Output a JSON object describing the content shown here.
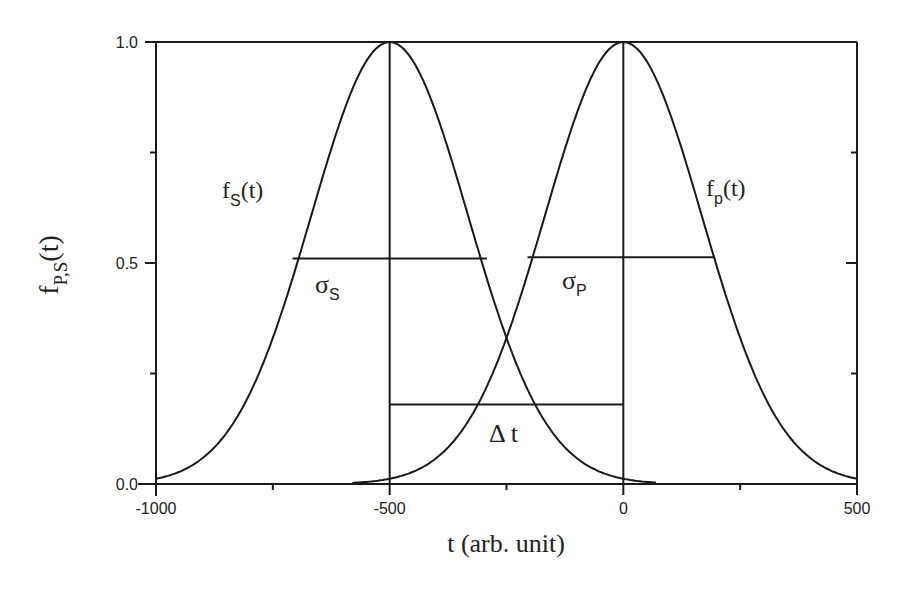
{
  "chart_data": {
    "type": "line",
    "title": "",
    "xlabel": "t (arb. unit)",
    "ylabel": {
      "main": "f",
      "sub": "P,S",
      "suffix": "(t)"
    },
    "xlim": [
      -1000,
      500
    ],
    "ylim": [
      0.0,
      1.0
    ],
    "xticks": [
      -1000,
      -500,
      0,
      500
    ],
    "xtick_labels": [
      "-1000",
      "-500",
      "0",
      "500"
    ],
    "xminor_ticks": [
      -750,
      -250,
      250
    ],
    "yticks": [
      0.0,
      0.5,
      1.0
    ],
    "ytick_labels": [
      "0.0",
      "0.5",
      "1.0"
    ],
    "yminor_ticks": [
      0.25,
      0.75
    ],
    "grid": false,
    "legend": null,
    "series": [
      {
        "name": "f_S(t)",
        "shape": "gaussian",
        "center": -500,
        "sigma": 168,
        "amplitude": 1.0,
        "x_range": [
          -1000,
          70
        ]
      },
      {
        "name": "f_P(t)",
        "shape": "gaussian",
        "center": 0,
        "sigma": 168,
        "amplitude": 1.0,
        "x_range": [
          -580,
          500
        ]
      }
    ],
    "annotations": [
      {
        "type": "vline",
        "x": -500,
        "y": [
          0.0,
          1.0
        ]
      },
      {
        "type": "vline",
        "x": 0,
        "y": [
          0.0,
          1.0
        ]
      },
      {
        "type": "hline",
        "label": "sigma_S",
        "x": [
          -708,
          -292
        ],
        "y": 0.51
      },
      {
        "type": "hline",
        "label": "sigma_P",
        "x": [
          -205,
          195
        ],
        "y": 0.513
      },
      {
        "type": "hline",
        "label": "delta_t",
        "x": [
          -500,
          0
        ],
        "y": 0.18
      }
    ]
  },
  "labels": {
    "fs": {
      "main": "f",
      "sub": "S",
      "suffix": "(t)"
    },
    "fp": {
      "main": "f",
      "sub": "p",
      "suffix": "(t)"
    },
    "sigma_s": {
      "main": "σ",
      "sub": "S"
    },
    "sigma_p": {
      "main": "σ",
      "sub": "P"
    },
    "delta_t": "Δ t"
  }
}
